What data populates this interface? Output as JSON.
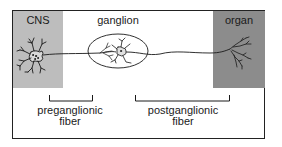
{
  "diagram": {
    "regions": [
      {
        "id": "cns",
        "label": "CNS",
        "color": "#bdbdbd"
      },
      {
        "id": "organ",
        "label": "organ",
        "color": "#8c8c8c"
      }
    ],
    "ganglion": {
      "label": "ganglion"
    },
    "fibers": [
      {
        "id": "preganglionic",
        "line1": "preganglionic",
        "line2": "fiber"
      },
      {
        "id": "postganglionic",
        "line1": "postganglionic",
        "line2": "fiber"
      }
    ],
    "colors": {
      "stroke": "#1a1a1a",
      "frame": "#222222",
      "background": "#ffffff"
    }
  }
}
